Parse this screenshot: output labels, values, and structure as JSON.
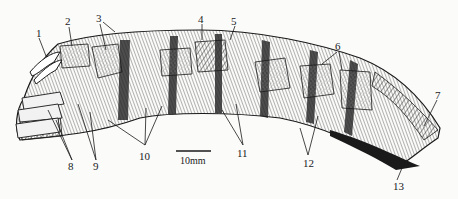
{
  "figure": {
    "type": "anatomical-line-drawing",
    "labels": [
      {
        "id": "1",
        "text": "1",
        "x": 36,
        "y": 28
      },
      {
        "id": "2",
        "text": "2",
        "x": 66,
        "y": 18
      },
      {
        "id": "3",
        "text": "3",
        "x": 97,
        "y": 14
      },
      {
        "id": "4",
        "text": "4",
        "x": 199,
        "y": 14
      },
      {
        "id": "5",
        "text": "5",
        "x": 232,
        "y": 16
      },
      {
        "id": "6",
        "text": "6",
        "x": 336,
        "y": 42
      },
      {
        "id": "7",
        "text": "7",
        "x": 436,
        "y": 91
      },
      {
        "id": "8",
        "text": "8",
        "x": 69,
        "y": 162
      },
      {
        "id": "9",
        "text": "9",
        "x": 94,
        "y": 162
      },
      {
        "id": "10",
        "text": "10",
        "x": 139,
        "y": 151
      },
      {
        "id": "11",
        "text": "11",
        "x": 238,
        "y": 148
      },
      {
        "id": "12",
        "text": "12",
        "x": 303,
        "y": 158
      },
      {
        "id": "13",
        "text": "13",
        "x": 394,
        "y": 181
      }
    ],
    "scale_bar": {
      "label": "10mm",
      "length_px": 35
    }
  },
  "colors": {
    "ink": "#1a1a1a",
    "paper": "#fbfbfa",
    "stipple": "#9a9a9a",
    "hatch": "#555555"
  }
}
